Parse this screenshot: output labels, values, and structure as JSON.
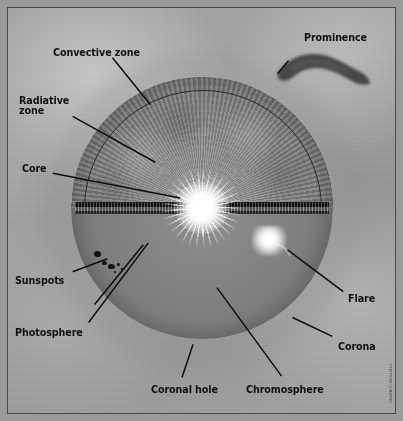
{
  "figure": {
    "credit": "GRAPHIC: NASA/ESA"
  },
  "labels": [
    {
      "id": "convective-zone",
      "text": "Convective zone",
      "x": 52,
      "y": 47,
      "size": 9.6,
      "align": "left"
    },
    {
      "id": "radiative-zone",
      "text": "Radiative\nzone",
      "x": 18,
      "y": 95,
      "size": 9.6,
      "align": "left"
    },
    {
      "id": "core",
      "text": "Core",
      "x": 21,
      "y": 163,
      "size": 9.6,
      "align": "left"
    },
    {
      "id": "sunspots",
      "text": "Sunspots",
      "x": 14,
      "y": 275,
      "size": 9.6,
      "align": "left"
    },
    {
      "id": "photosphere",
      "text": "Photosphere",
      "x": 14,
      "y": 327,
      "size": 9.6,
      "align": "left"
    },
    {
      "id": "coronal-hole",
      "text": "Coronal hole",
      "x": 150,
      "y": 384,
      "size": 9.6,
      "align": "left"
    },
    {
      "id": "chromosphere",
      "text": "Chromosphere",
      "x": 245,
      "y": 384,
      "size": 9.6,
      "align": "left"
    },
    {
      "id": "corona",
      "text": "Corona",
      "x": 337,
      "y": 341,
      "size": 9.6,
      "align": "left"
    },
    {
      "id": "flare",
      "text": "Flare",
      "x": 347,
      "y": 293,
      "size": 9.6,
      "align": "left"
    },
    {
      "id": "prominence",
      "text": "Prominence",
      "x": 303,
      "y": 32,
      "size": 9.6,
      "align": "left"
    }
  ],
  "leaders": [
    {
      "id": "leader-convective-zone",
      "x1": 112,
      "y1": 57,
      "x2": 150,
      "y2": 104
    },
    {
      "id": "leader-radiative-zone",
      "x1": 72,
      "y1": 116,
      "x2": 155,
      "y2": 162
    },
    {
      "id": "leader-core",
      "x1": 52,
      "y1": 173,
      "x2": 180,
      "y2": 198
    },
    {
      "id": "leader-sunspots",
      "x1": 72,
      "y1": 272,
      "x2": 107,
      "y2": 259
    },
    {
      "id": "leader-photosphere",
      "x1": 88,
      "y1": 323,
      "x2": 148,
      "y2": 243
    },
    {
      "id": "leader-photosphere-2",
      "x1": 94,
      "y1": 305,
      "x2": 143,
      "y2": 245
    },
    {
      "id": "leader-coronal-hole",
      "x1": 182,
      "y1": 378,
      "x2": 193,
      "y2": 345
    },
    {
      "id": "leader-chromosphere",
      "x1": 282,
      "y1": 377,
      "x2": 217,
      "y2": 288
    },
    {
      "id": "leader-corona",
      "x1": 333,
      "y1": 337,
      "x2": 293,
      "y2": 318
    },
    {
      "id": "leader-flare",
      "x1": 344,
      "y1": 292,
      "x2": 288,
      "y2": 250
    },
    {
      "id": "leader-prominence",
      "x1": 289,
      "y1": 60,
      "x2": 278,
      "y2": 73
    }
  ],
  "sun": {
    "center_x": 201,
    "center_y": 207,
    "radius": 131,
    "regions": [
      {
        "id": "convective-zone",
        "kind": "upper-shell-band"
      },
      {
        "id": "radiative-zone",
        "kind": "upper-interior"
      },
      {
        "id": "core",
        "kind": "bright-center-burst"
      },
      {
        "id": "photosphere",
        "kind": "lower-left-wedge",
        "start_deg": 182,
        "end_deg": 228
      },
      {
        "id": "chromosphere",
        "kind": "lower-center-wedge",
        "start_deg": 232,
        "end_deg": 298
      },
      {
        "id": "flare-sector",
        "kind": "lower-right-wedge",
        "start_deg": 302,
        "end_deg": 358
      }
    ],
    "sunspots": [
      {
        "cx": 96,
        "cy": 253,
        "w": 7,
        "h": 6
      },
      {
        "cx": 103,
        "cy": 262,
        "w": 5,
        "h": 4
      },
      {
        "cx": 110,
        "cy": 265,
        "w": 7,
        "h": 5
      },
      {
        "cx": 117,
        "cy": 263,
        "w": 3,
        "h": 3
      },
      {
        "cx": 121,
        "cy": 268,
        "w": 2,
        "h": 2
      },
      {
        "cx": 114,
        "cy": 271,
        "w": 2,
        "h": 2
      }
    ],
    "flare_blob": {
      "cx": 268,
      "cy": 240,
      "w": 34,
      "h": 30
    },
    "prominence": {
      "cx": 323,
      "cy": 62,
      "w": 86,
      "h": 42
    }
  },
  "colors": {
    "background": "#9a9a9a",
    "frame_border": "#4a4a4a",
    "label_text": "#111111",
    "leader_line": "#0d0d0d",
    "photosphere_wedge": "#e0e0e0",
    "chromosphere_wedge": "#757575",
    "flare_wedge": "#1a1a1a",
    "core_bright": "#ffffff"
  }
}
